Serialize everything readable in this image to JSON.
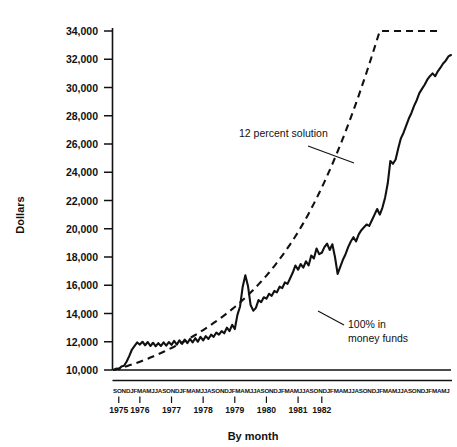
{
  "chart_data": {
    "type": "line",
    "title": "",
    "xlabel": "By month",
    "ylabel": "Dollars",
    "ylim": [
      10000,
      34000
    ],
    "ytick_labels": [
      "34,000",
      "32,000",
      "30,000",
      "28,000",
      "26,000",
      "24,000",
      "22,000",
      "20,000",
      "18,000",
      "16,000",
      "14,000",
      "12,000",
      "10,000"
    ],
    "ytick_values": [
      34000,
      32000,
      30000,
      28000,
      26000,
      24000,
      22000,
      20000,
      18000,
      16000,
      14000,
      12000,
      10000
    ],
    "grid": false,
    "legend_position": "inline-annotations",
    "x_start": "1975-09",
    "x_end": "1982-06",
    "month_letters_row": "SONDJFMAMJJASONDJFMAMJJASONDJFMAMJJASONDJFMAMJJASONDJFMAMJJASONDJFMAMJJASONDJFMAMJ",
    "year_ticks": [
      {
        "label": "1975",
        "month_index": 2
      },
      {
        "label": "1976",
        "month_index": 10
      },
      {
        "label": "1977",
        "month_index": 22
      },
      {
        "label": "1978",
        "month_index": 34
      },
      {
        "label": "1979",
        "month_index": 46
      },
      {
        "label": "1980",
        "month_index": 58
      },
      {
        "label": "1981",
        "month_index": 70
      },
      {
        "label": "1982",
        "month_index": 79
      }
    ],
    "annotations": [
      {
        "id": "series-1-label",
        "text": "12 percent solution",
        "lines": [
          "12 percent solution"
        ]
      },
      {
        "id": "series-2-label",
        "text": "100% in money funds",
        "lines": [
          "100% in",
          "money funds"
        ]
      }
    ],
    "series": [
      {
        "name": "12 percent solution",
        "style": "solid",
        "color": "#111111",
        "values": [
          10000,
          10100,
          10050,
          10250,
          10300,
          10600,
          11000,
          11450,
          11700,
          11950,
          11800,
          12000,
          11750,
          11980,
          11700,
          11930,
          11680,
          11900,
          11700,
          11950,
          11720,
          11980,
          11780,
          12060,
          11800,
          12100,
          11850,
          12150,
          11900,
          12200,
          11950,
          12250,
          12000,
          12350,
          12100,
          12400,
          12200,
          12500,
          12350,
          12650,
          12500,
          12750,
          12600,
          13000,
          12750,
          13200,
          12900,
          13900,
          14500,
          15900,
          16700,
          15950,
          14600,
          14200,
          14400,
          14950,
          14800,
          15150,
          15050,
          15400,
          15250,
          15600,
          15500,
          15900,
          15800,
          16200,
          16100,
          16500,
          16900,
          17400,
          17100,
          17500,
          17250,
          17700,
          17400,
          18100,
          17900,
          18600,
          18200,
          18300,
          18700,
          18950,
          18500,
          18900,
          18000,
          16800,
          17300,
          17800,
          18200,
          18700,
          19100,
          19400,
          19100,
          19600,
          19900,
          20100,
          20300,
          20200,
          20600,
          21000,
          21400,
          21000,
          21500,
          22200,
          23200,
          24800,
          24600,
          24900,
          25700,
          26400,
          26800,
          27300,
          27800,
          28200,
          28700,
          29100,
          29600,
          29900,
          30200,
          30550,
          30800,
          31000,
          30800,
          31150,
          31400,
          31700,
          31900,
          32200,
          32300
        ]
      },
      {
        "name": "100% in money funds",
        "style": "dashed",
        "color": "#111111",
        "values": [
          10000,
          10050,
          10100,
          10150,
          10210,
          10270,
          10330,
          10390,
          10450,
          10520,
          10590,
          10660,
          10730,
          10800,
          10880,
          10960,
          11040,
          11120,
          11200,
          11290,
          11380,
          11470,
          11560,
          11650,
          11750,
          11850,
          11950,
          12050,
          12150,
          12260,
          12370,
          12480,
          12590,
          12710,
          12830,
          12950,
          13070,
          13200,
          13330,
          13460,
          13590,
          13730,
          13870,
          14010,
          14160,
          14310,
          14460,
          14620,
          14780,
          14950,
          15120,
          15300,
          15480,
          15670,
          15860,
          16060,
          16260,
          16470,
          16680,
          16900,
          17130,
          17360,
          17600,
          17850,
          18100,
          18360,
          18630,
          18900,
          19180,
          19470,
          19770,
          20080,
          20400,
          20730,
          21070,
          21420,
          21780,
          22150,
          22530,
          22920,
          23320,
          23730,
          24150,
          24580,
          25020,
          25470,
          25930,
          26400,
          26880,
          27370,
          27870,
          28380,
          28900,
          29430,
          29970,
          30520,
          31080,
          31650,
          32230,
          32820,
          33420,
          34030,
          34650,
          35280,
          35920,
          36570,
          37230,
          37900,
          38580,
          39270,
          39970,
          40680,
          41400,
          42130,
          42870,
          43620,
          44380,
          45150,
          45930,
          46720,
          47520,
          48330,
          49150,
          49980,
          50820
        ]
      },
      {
        "name": "baseline",
        "style": "solid-flat",
        "color": "#111111",
        "values": [
          10000,
          10000
        ]
      }
    ]
  },
  "axis": {
    "y_label": "Dollars",
    "x_label": "By month"
  }
}
